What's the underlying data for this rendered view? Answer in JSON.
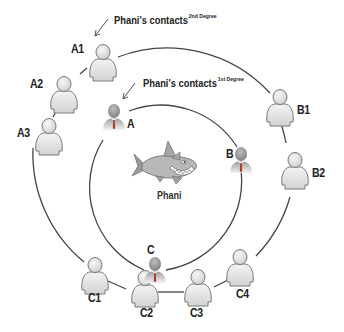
{
  "diagram": {
    "center": {
      "label": "Phani",
      "icon": "shark-icon"
    },
    "captions": {
      "second_degree": {
        "text": "Phani's contacts",
        "superscript": "2nd Degree"
      },
      "first_degree": {
        "text": "Phani's contacts",
        "superscript": "1st Degree"
      }
    },
    "first_degree_contacts": [
      {
        "label": "A"
      },
      {
        "label": "B"
      },
      {
        "label": "C"
      }
    ],
    "second_degree_contacts": [
      {
        "label": "A1"
      },
      {
        "label": "A2"
      },
      {
        "label": "A3"
      },
      {
        "label": "B1"
      },
      {
        "label": "B2"
      },
      {
        "label": "C1"
      },
      {
        "label": "C2"
      },
      {
        "label": "C3"
      },
      {
        "label": "C4"
      }
    ],
    "colors": {
      "line": "#444444",
      "person_fill": "#e4e4e4",
      "person_stroke": "#7a7a7a",
      "business_head": "#9a9a9a",
      "tie": "#b03a2e"
    }
  }
}
